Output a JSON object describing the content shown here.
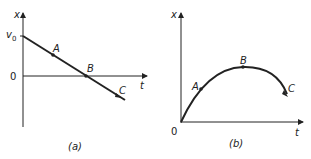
{
  "panels": [
    {
      "id": "a",
      "caption": "(a)",
      "y_axis_label": "x",
      "x_axis_label": "t",
      "y_intercept_label": "v",
      "y_intercept_sub": "0",
      "origin_label": "0",
      "curve_type": "straight line, negative slope",
      "points": [
        {
          "label": "A"
        },
        {
          "label": "B"
        },
        {
          "label": "C"
        }
      ]
    },
    {
      "id": "b",
      "caption": "(b)",
      "y_axis_label": "x",
      "x_axis_label": "t",
      "origin_label": "0",
      "curve_type": "concave-down parabola starting at origin",
      "points": [
        {
          "label": "A"
        },
        {
          "label": "B"
        },
        {
          "label": "C"
        }
      ]
    }
  ],
  "colors": {
    "ink": "#222222",
    "background": "#ffffff"
  }
}
